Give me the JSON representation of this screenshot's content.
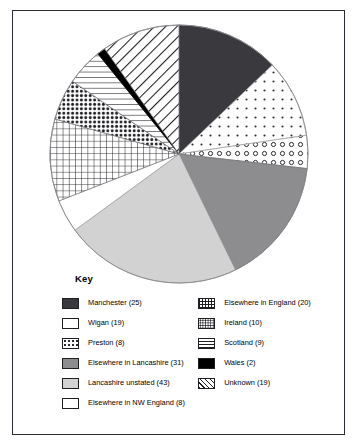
{
  "frame": {
    "border_color": "#2b2b33"
  },
  "key": {
    "title": "Key"
  },
  "chart_data": {
    "type": "pie",
    "title": "",
    "subtitle": "",
    "xlabel": "",
    "ylabel": "",
    "legend_position": "below",
    "grid": false,
    "total": 194,
    "start_angle_deg": 0,
    "direction": "clockwise",
    "categories": [
      "Manchester",
      "Wigan",
      "Preston",
      "Elsewhere in Lancashire",
      "Lancashire unstated",
      "Elsewhere in NW England",
      "Elsewhere in England",
      "Ireland",
      "Scotland",
      "Wales",
      "Unknown"
    ],
    "values": [
      25,
      19,
      8,
      31,
      43,
      8,
      20,
      10,
      9,
      2,
      19
    ],
    "slices": [
      {
        "label": "Manchester",
        "value": 25,
        "pattern": "solid-dark-gray",
        "color": "#3a3a3e"
      },
      {
        "label": "Wigan",
        "value": 19,
        "pattern": "sparse-dots",
        "color": "#ffffff"
      },
      {
        "label": "Preston",
        "value": 8,
        "pattern": "open-circles",
        "color": "#ffffff"
      },
      {
        "label": "Elsewhere in Lancashire",
        "value": 31,
        "pattern": "solid-medium-gray",
        "color": "#8d8d90"
      },
      {
        "label": "Lancashire unstated",
        "value": 43,
        "pattern": "solid-light-gray",
        "color": "#d2d2d2"
      },
      {
        "label": "Elsewhere in NW England",
        "value": 8,
        "pattern": "solid-white",
        "color": "#ffffff"
      },
      {
        "label": "Elsewhere in England",
        "value": 20,
        "pattern": "grid-crosshatch",
        "color": "#ffffff"
      },
      {
        "label": "Ireland",
        "value": 10,
        "pattern": "dense-dots",
        "color": "#ffffff"
      },
      {
        "label": "Scotland",
        "value": 9,
        "pattern": "horizontal-lines",
        "color": "#ffffff"
      },
      {
        "label": "Wales",
        "value": 2,
        "pattern": "solid-black",
        "color": "#000000"
      },
      {
        "label": "Unknown",
        "value": 19,
        "pattern": "diagonal-stripes",
        "color": "#ffffff"
      }
    ],
    "legend": {
      "left_column": [
        {
          "label": "Manchester (25)",
          "swatch": "sw-manchester"
        },
        {
          "label": "Wigan (19)",
          "swatch": "sw-wigan"
        },
        {
          "label": "Preston (8)",
          "swatch": "sw-preston"
        },
        {
          "label": "Elsewhere in Lancashire (31)",
          "swatch": "sw-elsewhere-lancs"
        },
        {
          "label": "Lancashire unstated (43)",
          "swatch": "sw-lancs-unstated"
        },
        {
          "label": "Elsewhere in NW England (8)",
          "swatch": "sw-nw-england"
        }
      ],
      "right_column": [
        {
          "label": "Elsewhere in England (20)",
          "swatch": "sw-elsewhere-england"
        },
        {
          "label": "Ireland (10)",
          "swatch": "sw-ireland"
        },
        {
          "label": "Scotland (9)",
          "swatch": "sw-scotland"
        },
        {
          "label": "Wales (2)",
          "swatch": "sw-wales"
        },
        {
          "label": "Unknown (19)",
          "swatch": "sw-unknown"
        }
      ]
    }
  }
}
